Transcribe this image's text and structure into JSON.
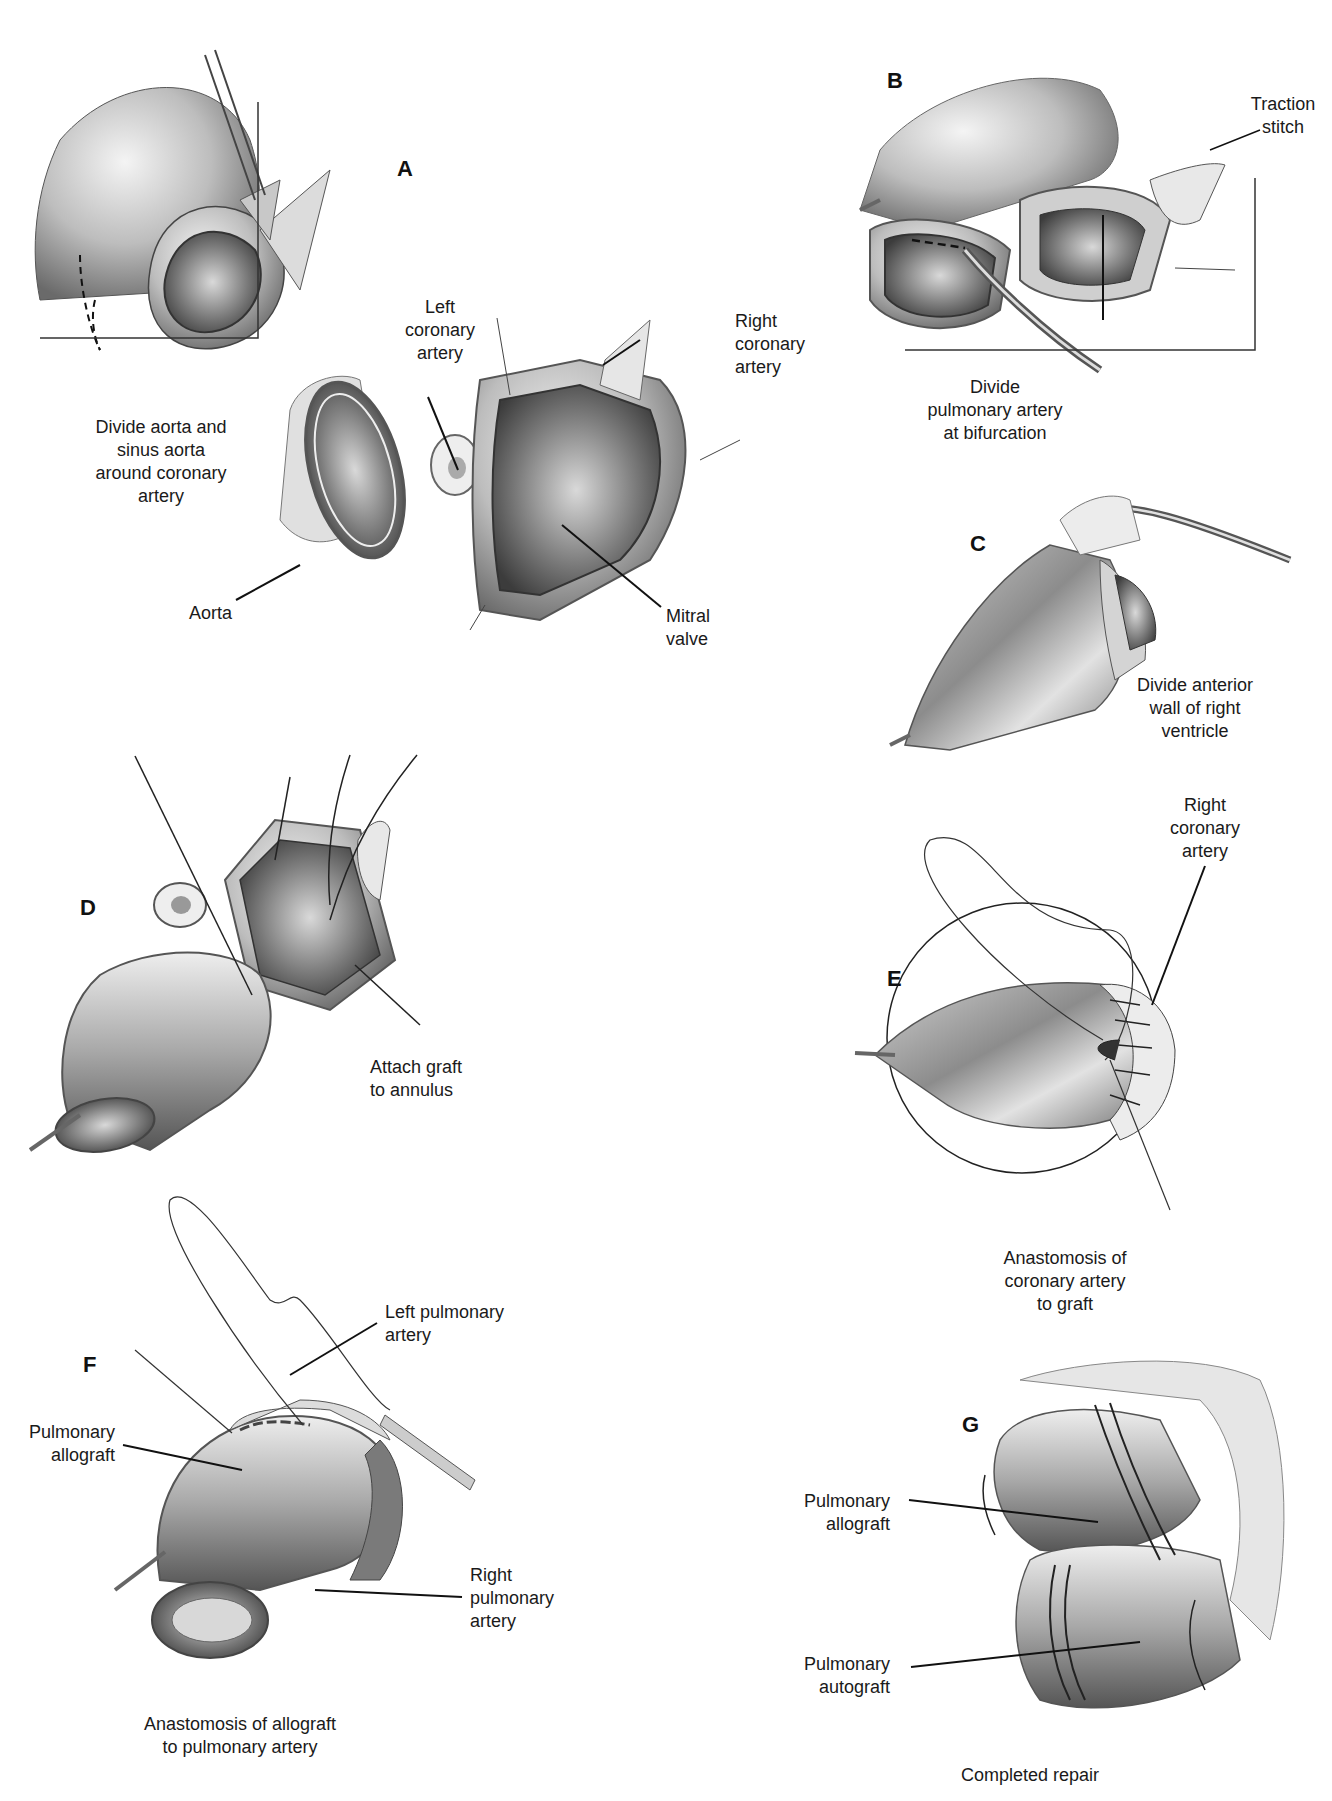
{
  "figure": {
    "panels": [
      {
        "id": "A",
        "letter": "A",
        "caption": "Divide aorta and\nsinus aorta\naround coronary\nartery",
        "labels": [
          "Left\ncoronary\nartery",
          "Right\ncoronary\nartery",
          "Aorta",
          "Mitral\nvalve"
        ]
      },
      {
        "id": "B",
        "letter": "B",
        "caption": "Divide\npulmonary artery\nat bifurcation",
        "labels": [
          "Traction\nstitch"
        ]
      },
      {
        "id": "C",
        "letter": "C",
        "caption": "Divide anterior\nwall of right\nventricle",
        "labels": []
      },
      {
        "id": "D",
        "letter": "D",
        "caption": "Attach graft\nto annulus",
        "labels": []
      },
      {
        "id": "E",
        "letter": "E",
        "caption": "Anastomosis of\ncoronary artery\nto graft",
        "labels": [
          "Right\ncoronary\nartery"
        ]
      },
      {
        "id": "F",
        "letter": "F",
        "caption": "Anastomosis of allograft\nto pulmonary artery",
        "labels": [
          "Left pulmonary\nartery",
          "Pulmonary\nallograft",
          "Right\npulmonary\nartery"
        ]
      },
      {
        "id": "G",
        "letter": "G",
        "caption": "Completed repair",
        "labels": [
          "Pulmonary\nallograft",
          "Pulmonary\nautograft"
        ]
      }
    ],
    "colors": {
      "ink": "#1a1a1a",
      "tissue_light": "#e8e8e8",
      "tissue_mid": "#b8b8b8",
      "tissue_dark": "#6e6e6e",
      "background": "#ffffff"
    }
  }
}
